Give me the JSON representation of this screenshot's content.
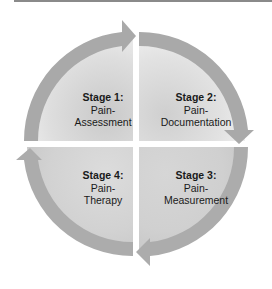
{
  "diagram": {
    "type": "cycle",
    "colors": {
      "arrow": "#a8a8a8",
      "fill_light": "#eeeeee",
      "fill_dark": "#cfcfcf",
      "text": "#1a1a1a"
    },
    "stages": [
      {
        "title": "Stage 1:",
        "line1": "Pain-",
        "line2": "Assessment"
      },
      {
        "title": "Stage 2:",
        "line1": "Pain-",
        "line2": "Documentation"
      },
      {
        "title": "Stage 3:",
        "line1": "Pain-",
        "line2": "Measurement"
      },
      {
        "title": "Stage 4:",
        "line1": "Pain-",
        "line2": "Therapy"
      }
    ]
  }
}
